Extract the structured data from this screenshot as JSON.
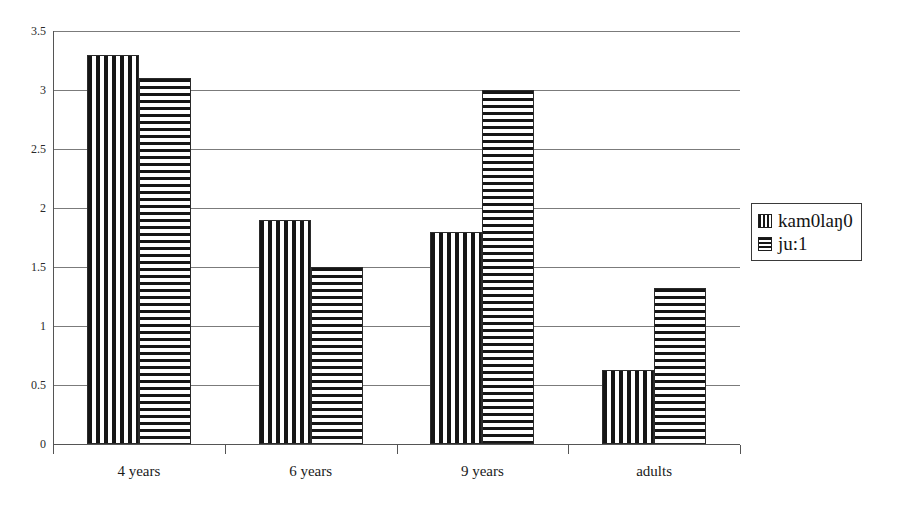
{
  "chart_data": {
    "type": "bar",
    "title": "",
    "xlabel": "",
    "ylabel": "",
    "categories": [
      "4 years",
      "6 years",
      "9 years",
      "adults"
    ],
    "series": [
      {
        "name": "kam0laŋ0",
        "pattern": "vertical-stripes",
        "values": [
          3.3,
          1.9,
          1.8,
          0.63
        ]
      },
      {
        "name": "ju:1",
        "pattern": "horizontal-stripes",
        "values": [
          3.1,
          1.5,
          3.0,
          1.32
        ]
      }
    ],
    "ylim": [
      0,
      3.5
    ],
    "ytick_labels": [
      "0",
      "0.5",
      "1",
      "1.5",
      "2",
      "2.5",
      "3",
      "3.5"
    ],
    "ytick_values": [
      0,
      0.5,
      1,
      1.5,
      2,
      2.5,
      3,
      3.5
    ],
    "grid": true,
    "legend_position": "right",
    "colors": {
      "line": "#7b7b7b",
      "axis": "#555555",
      "bar_outline": "#2b2b2b",
      "bar_fill_dark": "#161616",
      "bar_fill_light": "#ffffff",
      "background": "#ffffff",
      "text": "#1a1a1a"
    }
  },
  "legend": {
    "items": [
      {
        "label": "kam0laŋ0",
        "swatch": "vertical-stripe-swatch-icon"
      },
      {
        "label": "ju:1",
        "swatch": "horizontal-stripe-swatch-icon"
      }
    ]
  }
}
